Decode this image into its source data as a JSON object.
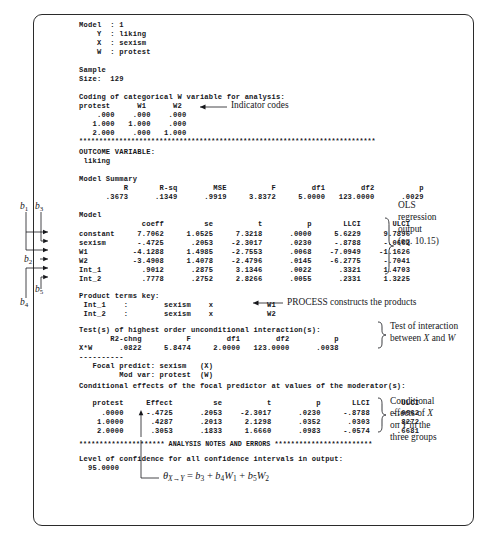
{
  "figure": {
    "border_color": "#2b2b2b"
  },
  "output_text": {
    "block1": "Model  : 1\n    Y  : liking\n    X  : sexism\n    W  : protest\n\nSample\nSize:  129\n\nCoding of categorical W variable for analysis:\nprotest      W1      W2\n    .000    .000    .000\n   1.000   1.000    .000\n   2.000    .000   1.000",
    "stars1": "**************************************************************************",
    "block2": "OUTCOME VARIABLE:\n liking\n\nModel Summary\n          R       R-sq        MSE          F        df1        df2          p\n      .3673      .1349      .9919     3.8372     5.0000   123.0000      .0029\n\nModel",
    "coeff_header": "              coeff         se          t          p       LLCI       ULCI",
    "coeff_rows": [
      "constant     7.7062     1.0525     7.3218      .0000     5.6229     9.7896",
      "sexism       -.4725      .2053    -2.3017      .0230     -.8788     -.0662",
      "W1          -4.1288     1.4985    -2.7553      .0068    -7.0949    -1.1626",
      "W2          -3.4908     1.4078    -2.4796      .0145    -6.2775     -.7041",
      "Int_1         .9012      .2875     3.1346      .0022      .3321     1.4703",
      "Int_2         .7778      .2752     2.8266      .0055      .2331     1.3225"
    ],
    "block3": "Product terms key:\n Int_1    :        sexism    x            W1\n Int_2    :        sexism    x            W2",
    "block4": "Test(s) of highest order unconditional interaction(s):\n       R2-chng          F        df1        df2          p\nX*W      .0822     5.8474     2.0000   123.0000      .0038\n----------\n   Focal predict: sexism   (X)\n         Mod var: protest  (W)",
    "block5": "Conditional effects of the focal predictor at values of the moderator(s):",
    "cond_header": "   protest     Effect         se          t          p       LLCI       ULCI",
    "cond_rows": [
      "     .0000     -.4725      .2053    -2.3017      .0230     -.8788     -.0662",
      "    1.0000      .4287      .2013     2.1298      .0352      .0303      .8272",
      "    2.0000      .3053      .1833     1.6660      .0983     -.0574      .6681"
    ],
    "stars2": "********************* ANALYSIS NOTES AND ERRORS ************************",
    "block6": "Level of confidence for all confidence intervals in output:\n  95.0000"
  },
  "annotations": {
    "indicator_codes": "Indicator codes",
    "ols_output_line1": "OLS",
    "ols_output_line2": "regression",
    "ols_output_line3": "output",
    "ols_output_line4": "(eq. 10.15)",
    "process_products": "PROCESS constructs the products",
    "test_interaction_line1": "Test of interaction",
    "test_interaction_line2_pre": "between ",
    "test_interaction_X": "X",
    "test_interaction_mid": " and ",
    "test_interaction_W": "W",
    "cond_effects_line1": "Conditional",
    "cond_effects_line2_pre": "effects of ",
    "cond_effects_X": "X",
    "cond_effects_line3_pre": "on ",
    "cond_effects_Y": "Y",
    "cond_effects_line3_post": " in the",
    "cond_effects_line4": "three groups"
  },
  "b_labels": {
    "b1": "b",
    "b1_sub": "1",
    "b2": "b",
    "b2_sub": "2",
    "b3": "b",
    "b3_sub": "3",
    "b4": "b",
    "b4_sub": "4",
    "b5": "b",
    "b5_sub": "5"
  },
  "equation": {
    "theta": "θ",
    "theta_sub_x": "X",
    "theta_arrow": "→",
    "theta_sub_y": "Y",
    "rhs_eq": " = ",
    "b3": "b",
    "b3_sub": "3",
    "plus1": " + ",
    "b4": "b",
    "b4_sub": "4",
    "W1": "W",
    "W1_sub": "1",
    "plus2": " + ",
    "b5": "b",
    "b5_sub": "5",
    "W2": "W",
    "W2_sub": "2"
  }
}
